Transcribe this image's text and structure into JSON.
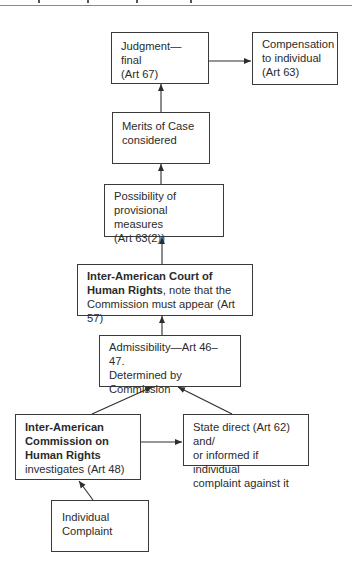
{
  "diagram": {
    "type": "flowchart",
    "nodes": [
      {
        "id": "judgment",
        "lines": [
          "Judgment—final",
          "(Art 67)"
        ]
      },
      {
        "id": "compensation",
        "lines": [
          "Compensation",
          "to individual",
          "(Art 63)"
        ]
      },
      {
        "id": "merits",
        "lines": [
          "Merits of Case",
          "considered"
        ]
      },
      {
        "id": "provisional",
        "lines": [
          "Possibility of",
          "provisional measures",
          "(Art 63(2))"
        ]
      },
      {
        "id": "court",
        "bold_line_1": "Inter-American Court of",
        "bold_line_2": "Human Rights",
        "line_2_rest": ", note that the",
        "line_3": "Commission must appear (Art 57)"
      },
      {
        "id": "admissibility",
        "lines": [
          "Admissibility—Art 46–47.",
          "Determined by",
          "Commission"
        ]
      },
      {
        "id": "commission",
        "bold_lines": [
          "Inter-American",
          "Commission on",
          "Human Rights"
        ],
        "line_4": "investigates (Art 48)"
      },
      {
        "id": "state",
        "lines": [
          "State direct (Art 62) and/",
          "or informed if individual",
          "complaint against it"
        ]
      },
      {
        "id": "individual",
        "lines": [
          "Individual",
          "Complaint"
        ]
      }
    ],
    "edges": [
      {
        "from": "individual",
        "to": "commission"
      },
      {
        "from": "commission",
        "to": "state"
      },
      {
        "from": "commission",
        "to": "admissibility"
      },
      {
        "from": "state",
        "to": "admissibility"
      },
      {
        "from": "admissibility",
        "to": "court"
      },
      {
        "from": "court",
        "to": "provisional"
      },
      {
        "from": "provisional",
        "to": "merits"
      },
      {
        "from": "merits",
        "to": "judgment"
      },
      {
        "from": "judgment",
        "to": "compensation"
      }
    ],
    "colors": {
      "stroke": "#3a3a3a",
      "text": "#2b2b2b",
      "background": "#ffffff"
    }
  }
}
